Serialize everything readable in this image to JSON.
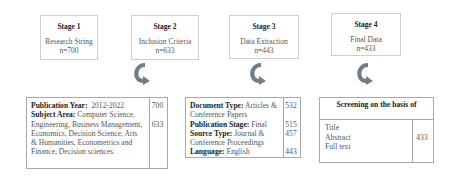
{
  "stages": [
    {
      "title": "Stage 1",
      "desc": "Research String",
      "n": "n=700"
    },
    {
      "title": "Stage 2",
      "desc": "Inclusion Criteria",
      "n": "n=633"
    },
    {
      "title": "Stage 3",
      "desc": "Data Extraction",
      "n": "n=443"
    },
    {
      "title": "Stage 4",
      "desc": "Final Data",
      "n": "n=433"
    }
  ],
  "arrow_color": "#6f7f8a",
  "table1": {
    "pub_year_label": "Publication Year:",
    "pub_year_value": "2012-2022",
    "subject_label": "Subject Area:",
    "subject_value": "Computer Science, Engineering, Business Management, Economics, Decision Science, Arts & Humanities, Econometrics and Finance, Decision sciences.",
    "counts": [
      "700",
      "633"
    ]
  },
  "table2": {
    "doc_type_label": "Document Type:",
    "doc_type_value": "Articles & Conference Papers",
    "pub_stage_label": "Publication Stage:",
    "pub_stage_value": "Final",
    "source_label": "Source Type:",
    "source_value": "Journal & Conference Proceedings",
    "language_label": "Language:",
    "language_value": "English",
    "counts": [
      "532",
      "515",
      "457",
      "443"
    ]
  },
  "table3": {
    "header": "Screening on the basis of",
    "items": [
      "Title",
      "Abstract",
      "Full text"
    ],
    "count": "433"
  }
}
